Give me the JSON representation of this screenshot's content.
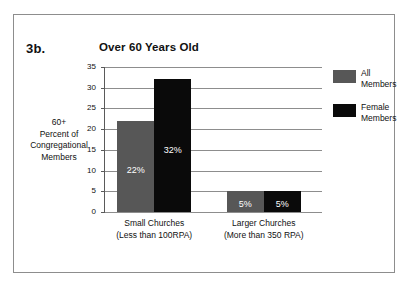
{
  "figure": {
    "panel_id": "3b.",
    "frame_color": "#8d8d8d"
  },
  "chart_data": {
    "type": "bar",
    "title": "Over 60 Years Old",
    "xlabel": "",
    "ylabel": "60+ Percent of Congregational Members",
    "ylabel_lines": [
      "60+",
      "Percent of",
      "Congregational",
      "Members"
    ],
    "ylim": [
      0,
      35
    ],
    "yticks": [
      0,
      5,
      10,
      15,
      20,
      25,
      30,
      35
    ],
    "ytick_labels": [
      "0",
      "5",
      "10",
      "15",
      "20",
      "25",
      "30",
      "35"
    ],
    "grid": true,
    "legend_position": "right",
    "categories": [
      "Small Churches",
      "Larger Churches"
    ],
    "category_sublabels": [
      "(Less than 100RPA)",
      "(More than 350 RPA)"
    ],
    "series": [
      {
        "name": "All Members",
        "name_lines": [
          "All",
          "Members"
        ],
        "color": "#575757",
        "values": [
          22,
          5
        ],
        "data_labels": [
          "22%",
          "5%"
        ]
      },
      {
        "name": "Female Members",
        "name_lines": [
          "Female",
          "Members"
        ],
        "color": "#0a0a0a",
        "values": [
          32,
          5
        ],
        "data_labels": [
          "32%",
          "5%"
        ]
      }
    ]
  }
}
